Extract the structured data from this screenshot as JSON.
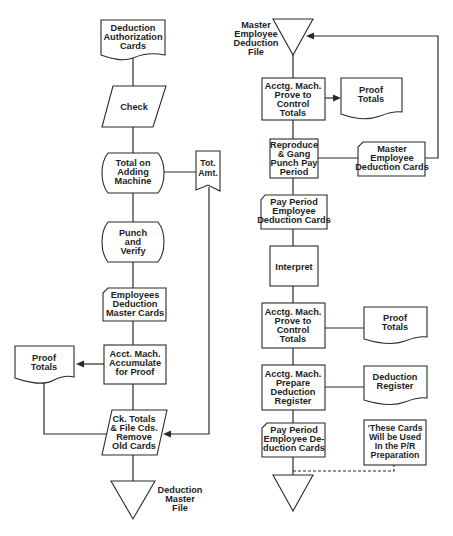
{
  "diagram": {
    "type": "flowchart",
    "left_flow": {
      "nodes": [
        {
          "id": "L1",
          "shape": "document",
          "lines": [
            "Deduction",
            "Authorization",
            "Cards"
          ]
        },
        {
          "id": "L2",
          "shape": "manual-input",
          "lines": [
            "Check"
          ]
        },
        {
          "id": "L3",
          "shape": "manual-operation-rounded",
          "lines": [
            "Total on",
            "Adding",
            "Machine"
          ]
        },
        {
          "id": "L3b",
          "shape": "tape",
          "lines": [
            "Tot.",
            "Amt."
          ]
        },
        {
          "id": "L4",
          "shape": "manual-operation-rounded",
          "lines": [
            "Punch",
            "and",
            "Verify"
          ]
        },
        {
          "id": "L5",
          "shape": "card",
          "lines": [
            "Employees",
            "Deduction",
            "Master Cards"
          ]
        },
        {
          "id": "L6",
          "shape": "process",
          "lines": [
            "Acct. Mach.",
            "Accumulate",
            "for Proof"
          ]
        },
        {
          "id": "L6b",
          "shape": "document",
          "lines": [
            "Proof",
            "Totals"
          ]
        },
        {
          "id": "L7",
          "shape": "manual-input",
          "lines": [
            "Ck. Totals",
            "& File Cds.",
            "Remove",
            "Old Cards"
          ]
        },
        {
          "id": "L8",
          "shape": "offline-storage",
          "lines": [],
          "label": [
            "Deduction",
            "Master",
            "File"
          ]
        }
      ]
    },
    "right_flow": {
      "nodes": [
        {
          "id": "R1",
          "shape": "offline-storage",
          "lines": [],
          "label": [
            "Master",
            "Employee",
            "Deduction",
            "File"
          ]
        },
        {
          "id": "R2",
          "shape": "process",
          "lines": [
            "Acctg. Mach.",
            "Prove to",
            "Control",
            "Totals"
          ]
        },
        {
          "id": "R2b",
          "shape": "document",
          "lines": [
            "Proof",
            "Totals"
          ]
        },
        {
          "id": "R3",
          "shape": "process",
          "lines": [
            "Reproduce",
            "& Gang",
            "Punch Pay",
            "Period"
          ]
        },
        {
          "id": "R3b",
          "shape": "card",
          "lines": [
            "Master",
            "Employee",
            "Deduction Cards"
          ]
        },
        {
          "id": "R4",
          "shape": "card",
          "lines": [
            "Pay Period",
            "Employee",
            "Deduction Cards"
          ]
        },
        {
          "id": "R5",
          "shape": "process",
          "lines": [
            "Interpret"
          ]
        },
        {
          "id": "R6",
          "shape": "process",
          "lines": [
            "Acctg. Mach.",
            "Prove to",
            "Control",
            "Totals"
          ]
        },
        {
          "id": "R6b",
          "shape": "document",
          "lines": [
            "Proof",
            "Totals"
          ]
        },
        {
          "id": "R7",
          "shape": "process",
          "lines": [
            "Acctg. Mach.",
            "Prepare",
            "Deduction",
            "Register"
          ]
        },
        {
          "id": "R7b",
          "shape": "document",
          "lines": [
            "Deduction",
            "Register"
          ]
        },
        {
          "id": "R8",
          "shape": "card",
          "lines": [
            "Pay Period",
            "Employee De-",
            "duction Cards"
          ]
        },
        {
          "id": "R8b",
          "shape": "annotation",
          "lines": [
            "‘These Cards",
            "Will be Used",
            "In the P/R",
            "Preparation"
          ]
        },
        {
          "id": "R9",
          "shape": "offline-storage",
          "lines": []
        }
      ]
    }
  }
}
